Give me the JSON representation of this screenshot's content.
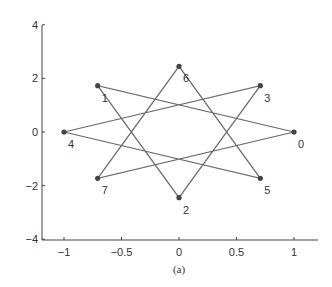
{
  "chart_data": {
    "type": "line",
    "title": "",
    "caption": "(a)",
    "xlabel": "",
    "ylabel": "",
    "xlim": [
      -1.2,
      1.2
    ],
    "ylim": [
      -4,
      4
    ],
    "xticks": [
      -1,
      -0.5,
      0,
      0.5,
      1
    ],
    "xtick_labels": [
      "−1",
      "−0.5",
      "0",
      "0.5",
      "1"
    ],
    "yticks": [
      4,
      2,
      0,
      -2,
      -4
    ],
    "ytick_labels": [
      "4",
      "2",
      "0",
      "−2",
      "−4"
    ],
    "grid": false,
    "legend": null,
    "points": [
      {
        "label": "0",
        "x": 1.0,
        "y": 0.0
      },
      {
        "label": "1",
        "x": -0.707,
        "y": 1.73
      },
      {
        "label": "2",
        "x": 0.0,
        "y": -2.45
      },
      {
        "label": "3",
        "x": 0.707,
        "y": 1.73
      },
      {
        "label": "4",
        "x": -1.0,
        "y": 0.0
      },
      {
        "label": "5",
        "x": 0.707,
        "y": -1.73
      },
      {
        "label": "6",
        "x": 0.0,
        "y": 2.45
      },
      {
        "label": "7",
        "x": -0.707,
        "y": -1.73
      }
    ],
    "edges_order": [
      "0",
      "1",
      "2",
      "3",
      "4",
      "5",
      "6",
      "7",
      "0"
    ],
    "line_color": "#6a6a6a",
    "marker_color": "#444444"
  }
}
